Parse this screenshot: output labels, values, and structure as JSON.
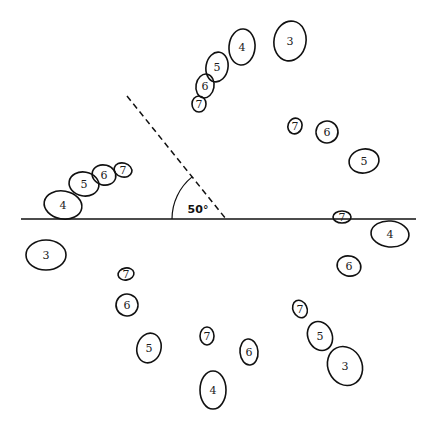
{
  "diagram": {
    "title": "",
    "colors": {
      "stroke": "#111111",
      "background": "#ffffff"
    },
    "baseline": {
      "x1": 21,
      "y1": 219,
      "x2": 416,
      "y2": 219
    },
    "dashed_line": {
      "x1": 127,
      "y1": 96,
      "x2": 226,
      "y2": 219
    },
    "angle": {
      "label": "50°",
      "vertex": [
        226,
        219
      ],
      "radius": 54,
      "label_pos": [
        198,
        213
      ]
    },
    "ellipses": [
      {
        "id": "top-3",
        "label": "3",
        "cx": 290,
        "cy": 41,
        "rx": 16,
        "ry": 20,
        "rot": 10
      },
      {
        "id": "top-4",
        "label": "4",
        "cx": 242,
        "cy": 47,
        "rx": 13,
        "ry": 18,
        "rot": 5
      },
      {
        "id": "top-5",
        "label": "5",
        "cx": 217,
        "cy": 67,
        "rx": 11,
        "ry": 15,
        "rot": 10
      },
      {
        "id": "top-6",
        "label": "6",
        "cx": 205,
        "cy": 86,
        "rx": 9,
        "ry": 12,
        "rot": 10
      },
      {
        "id": "top-7",
        "label": "7",
        "cx": 199,
        "cy": 104,
        "rx": 7,
        "ry": 8,
        "rot": 0
      },
      {
        "id": "left-4",
        "label": "4",
        "cx": 63,
        "cy": 205,
        "rx": 19,
        "ry": 14,
        "rot": 10
      },
      {
        "id": "left-5",
        "label": "5",
        "cx": 84,
        "cy": 184,
        "rx": 15,
        "ry": 12,
        "rot": 10
      },
      {
        "id": "left-6",
        "label": "6",
        "cx": 104,
        "cy": 175,
        "rx": 12,
        "ry": 10,
        "rot": 15
      },
      {
        "id": "left-7",
        "label": "7",
        "cx": 123,
        "cy": 170,
        "rx": 9,
        "ry": 7,
        "rot": 15
      },
      {
        "id": "left-3",
        "label": "3",
        "cx": 46,
        "cy": 255,
        "rx": 20,
        "ry": 15,
        "rot": 0
      },
      {
        "id": "right-7a",
        "label": "7",
        "cx": 295,
        "cy": 126,
        "rx": 7,
        "ry": 8,
        "rot": 20
      },
      {
        "id": "right-6a",
        "label": "6",
        "cx": 327,
        "cy": 132,
        "rx": 11,
        "ry": 11,
        "rot": -20
      },
      {
        "id": "right-5",
        "label": "5",
        "cx": 364,
        "cy": 161,
        "rx": 15,
        "ry": 12,
        "rot": -10
      },
      {
        "id": "right-7b",
        "label": "7",
        "cx": 342,
        "cy": 217,
        "rx": 9,
        "ry": 6,
        "rot": 0
      },
      {
        "id": "right-4",
        "label": "4",
        "cx": 390,
        "cy": 234,
        "rx": 19,
        "ry": 13,
        "rot": 5
      },
      {
        "id": "right-6b",
        "label": "6",
        "cx": 349,
        "cy": 266,
        "rx": 12,
        "ry": 10,
        "rot": 15
      },
      {
        "id": "lowleft-7",
        "label": "7",
        "cx": 126,
        "cy": 274,
        "rx": 8,
        "ry": 6,
        "rot": -10
      },
      {
        "id": "lowleft-6",
        "label": "6",
        "cx": 127,
        "cy": 305,
        "rx": 11,
        "ry": 11,
        "rot": 20
      },
      {
        "id": "lowleft-5",
        "label": "5",
        "cx": 149,
        "cy": 348,
        "rx": 12,
        "ry": 15,
        "rot": 15
      },
      {
        "id": "lowmid-7",
        "label": "7",
        "cx": 207,
        "cy": 336,
        "rx": 7,
        "ry": 9,
        "rot": 0
      },
      {
        "id": "lowmid-6",
        "label": "6",
        "cx": 249,
        "cy": 352,
        "rx": 9,
        "ry": 13,
        "rot": -5
      },
      {
        "id": "lowmid-4",
        "label": "4",
        "cx": 213,
        "cy": 390,
        "rx": 13,
        "ry": 19,
        "rot": 0
      },
      {
        "id": "lowright-7",
        "label": "7",
        "cx": 300,
        "cy": 309,
        "rx": 7,
        "ry": 9,
        "rot": -25
      },
      {
        "id": "lowright-5",
        "label": "5",
        "cx": 320,
        "cy": 336,
        "rx": 12,
        "ry": 15,
        "rot": -25
      },
      {
        "id": "lowright-3",
        "label": "3",
        "cx": 345,
        "cy": 366,
        "rx": 17,
        "ry": 20,
        "rot": -25
      }
    ]
  }
}
